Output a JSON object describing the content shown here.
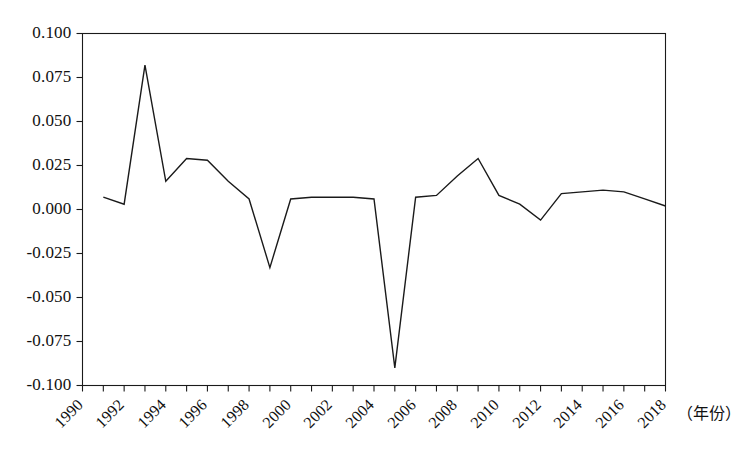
{
  "chart_data": {
    "type": "line",
    "title": "",
    "subtitle": "",
    "xlabel": "（年份）",
    "ylabel": "",
    "xlim": [
      1990,
      2018
    ],
    "ylim": [
      -0.1,
      0.1
    ],
    "grid": false,
    "legend": null,
    "line_color": "#1a1a1a",
    "x": [
      1991,
      1992,
      1993,
      1994,
      1995,
      1996,
      1997,
      1998,
      1999,
      2000,
      2001,
      2002,
      2003,
      2004,
      2005,
      2006,
      2007,
      2008,
      2009,
      2010,
      2011,
      2012,
      2013,
      2014,
      2015,
      2016,
      2017,
      2018
    ],
    "series": [
      {
        "name": "series-1",
        "values": [
          0.007,
          0.003,
          0.082,
          0.016,
          0.029,
          0.028,
          0.016,
          0.006,
          -0.033,
          0.006,
          0.007,
          0.007,
          0.007,
          0.006,
          -0.09,
          0.007,
          0.008,
          0.019,
          0.029,
          0.008,
          0.003,
          -0.006,
          0.009,
          0.01,
          0.011,
          0.01,
          0.006,
          0.002
        ]
      }
    ],
    "x_tick_labels": [
      "1990",
      "1992",
      "1994",
      "1996",
      "1998",
      "2000",
      "2002",
      "2004",
      "2006",
      "2008",
      "2010",
      "2012",
      "2014",
      "2016",
      "2018"
    ],
    "x_tick_values": [
      1990,
      1992,
      1994,
      1996,
      1998,
      2000,
      2002,
      2004,
      2006,
      2008,
      2010,
      2012,
      2014,
      2016,
      2018
    ],
    "x_minor_tick_values": [
      1990,
      1991,
      1992,
      1993,
      1994,
      1995,
      1996,
      1997,
      1998,
      1999,
      2000,
      2001,
      2002,
      2003,
      2004,
      2005,
      2006,
      2007,
      2008,
      2009,
      2010,
      2011,
      2012,
      2013,
      2014,
      2015,
      2016,
      2017,
      2018
    ],
    "y_tick_labels": [
      "0.100",
      "0.075",
      "0.050",
      "0.025",
      "0.000",
      "-0.025",
      "-0.050",
      "-0.075",
      "-0.100"
    ],
    "y_tick_values": [
      0.1,
      0.075,
      0.05,
      0.025,
      0.0,
      -0.025,
      -0.05,
      -0.075,
      -0.1
    ]
  }
}
